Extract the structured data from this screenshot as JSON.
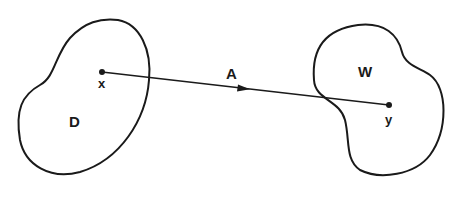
{
  "diagram": {
    "regions": [
      {
        "id": "D",
        "label": "D",
        "point_label": "x"
      },
      {
        "id": "W",
        "label": "W",
        "point_label": "y"
      }
    ],
    "path": {
      "label": "A",
      "from": "x",
      "to": "y",
      "directed": true
    },
    "colors": {
      "stroke": "#1a1a1a",
      "background": "#ffffff"
    }
  }
}
